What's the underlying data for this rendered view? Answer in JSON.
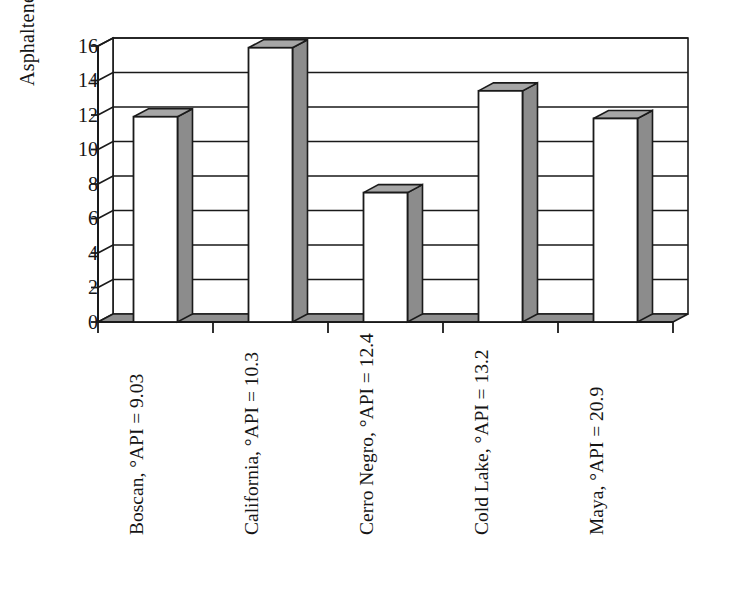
{
  "chart_data": {
    "type": "bar",
    "title": "",
    "subtitle": "",
    "xlabel": "",
    "ylabel": "Asphaltenes, wt%",
    "ylim": [
      0,
      16
    ],
    "yticks": [
      0,
      2,
      4,
      6,
      8,
      10,
      12,
      14,
      16
    ],
    "ytick_labels": [
      "0",
      "2",
      "4",
      "6",
      "8",
      "10",
      "12",
      "14",
      "16"
    ],
    "grid": true,
    "grid_axis": "y",
    "legend": false,
    "legend_position": "none",
    "style": "3d-bar",
    "categories": [
      "Boscan, °API = 9.03",
      "California, °API = 10.3",
      "Cerro Negro, °API = 12.4",
      "Cold Lake, °API = 13.2",
      "Maya, °API = 20.9"
    ],
    "values": [
      11.9,
      15.9,
      7.5,
      13.4,
      11.8
    ],
    "series": [
      {
        "name": "Asphaltenes",
        "values": [
          11.9,
          15.9,
          7.5,
          13.4,
          11.8
        ]
      }
    ],
    "bar_face_color": "#ffffff",
    "bar_side_color": "#8c8c8c",
    "bar_top_color": "#a6a6a6",
    "bar_edge_color": "#1a1a1a",
    "axis_color": "#1a1a1a",
    "grid_color": "#1a1a1a",
    "background_color": "#ffffff"
  },
  "axes": {
    "y_title": "Asphaltenes, wt%",
    "y_tick_labels": [
      "16",
      "14",
      "12",
      "10",
      "8",
      "6",
      "4",
      "2",
      "0"
    ],
    "x_tick_labels": [
      "Boscan, °API = 9.03",
      "California, °API = 10.3",
      "Cerro Negro, °API = 12.4",
      "Cold Lake, °API = 13.2",
      "Maya, °API = 20.9"
    ]
  }
}
